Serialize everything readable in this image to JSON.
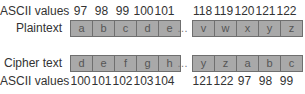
{
  "labels": {
    "top_ascii": "ASCII values",
    "plaintext": "Plaintext",
    "ciphertext": "Cipher text",
    "bottom_ascii": "ASCII values"
  },
  "ellipsis": "…",
  "plaintext": {
    "left": [
      "a",
      "b",
      "c",
      "d",
      "e"
    ],
    "right": [
      "v",
      "w",
      "x",
      "y",
      "z"
    ],
    "ascii_left": [
      "97",
      "98",
      "99",
      "100",
      "101"
    ],
    "ascii_right": [
      "118",
      "119",
      "120",
      "121",
      "122"
    ]
  },
  "ciphertext": {
    "left": [
      "d",
      "e",
      "f",
      "g",
      "h"
    ],
    "right": [
      "y",
      "z",
      "a",
      "b",
      "c"
    ],
    "ascii_left": [
      "100",
      "101",
      "102",
      "103",
      "104"
    ],
    "ascii_right": [
      "121",
      "122",
      "97",
      "98",
      "99"
    ]
  },
  "colors": {
    "box_fill": "#a9a9a9",
    "box_border": "#6f6f6f"
  }
}
